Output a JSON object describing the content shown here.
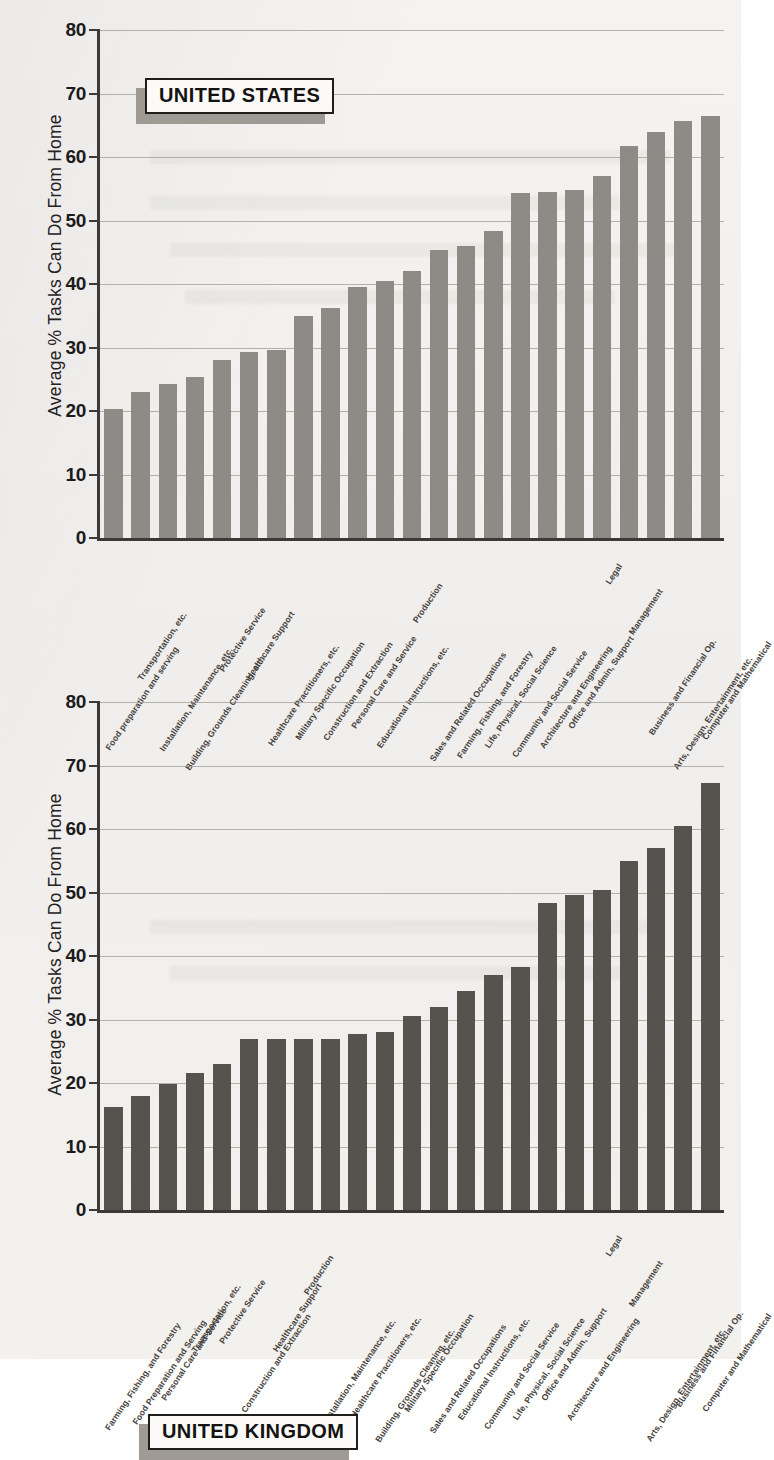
{
  "page": {
    "background_color": "#f2f1ef",
    "axis_color": "#3c3a36",
    "gridline_color": "#9c9790"
  },
  "charts": [
    {
      "id": "us-chart",
      "callout_label": "UNITED STATES",
      "bar_color": "#8e8b86",
      "chart_data": {
        "type": "bar",
        "title": "UNITED STATES",
        "xlabel": "",
        "ylabel": "Average % Tasks Can Do From Home",
        "ylim": [
          0,
          80
        ],
        "yticks": [
          0,
          10,
          20,
          30,
          40,
          50,
          60,
          70,
          80
        ],
        "grid": true,
        "legend": "none",
        "categories": [
          "Food preparation and serving",
          "Transportation, etc.",
          "Installation, Maintenance, etc.",
          "Building, Grounds Cleaning, etc.",
          "Protective Service",
          "Healthcare Support",
          "Healthcare Practitioners, etc.",
          "Military Specific Occupation",
          "Construction and Extraction",
          "Personal Care and Service",
          "Educational Instructions, etc.",
          "Production",
          "Sales and Related Occupations",
          "Farming, Fishing, and Forestry",
          "Life, Physical, Social Science",
          "Community and Social Service",
          "Architecture and Engineering",
          "Office and Admin, Support",
          "Legal",
          "Management",
          "Business and Financial Op.",
          "Arts, Design, Entertainment, etc.",
          "Computer and Mathematical"
        ],
        "values": [
          20.3,
          23.0,
          24.3,
          25.3,
          28.0,
          29.3,
          29.6,
          35.0,
          36.2,
          39.5,
          40.4,
          42.1,
          45.3,
          46.0,
          48.3,
          54.3,
          54.5,
          54.8,
          57.0,
          61.7,
          64.0,
          65.6,
          66.5
        ]
      }
    },
    {
      "id": "uk-chart",
      "callout_label": "UNITED KINGDOM",
      "bar_color": "#56534e",
      "chart_data": {
        "type": "bar",
        "title": "UNITED KINGDOM",
        "xlabel": "",
        "ylabel": "Average % Tasks Can Do From Home",
        "ylim": [
          0,
          80
        ],
        "yticks": [
          0,
          10,
          20,
          30,
          40,
          50,
          60,
          70,
          80
        ],
        "grid": true,
        "legend": "none",
        "categories": [
          "Farming, Fishing, and Forestry",
          "Food Preparation and Serving",
          "Personal Care and Service",
          "Transportation, etc.",
          "Protective Service",
          "Construction and Extraction",
          "Healthcare Support",
          "Production",
          "Installation, Maintenance, etc.",
          "Healthcare Practitioners, etc.",
          "Building, Grounds Cleaning, etc.",
          "Military Specific Occupation",
          "Sales and Related Occupations",
          "Educational Instructions, etc.",
          "Community and Social Service",
          "Life, Physical, Social Science",
          "Office and Admin, Support",
          "Architecture and Engineering",
          "Legal",
          "Management",
          "Arts, Design, Entertainment, etc.",
          "Business and Financial Op.",
          "Computer and Mathematical"
        ],
        "values": [
          16.2,
          18.0,
          19.9,
          21.5,
          23.0,
          26.9,
          26.9,
          26.9,
          27.0,
          27.7,
          28.1,
          30.5,
          32.0,
          34.5,
          37.0,
          38.3,
          48.3,
          49.6,
          50.4,
          55.0,
          57.0,
          60.5,
          67.3
        ]
      }
    }
  ]
}
